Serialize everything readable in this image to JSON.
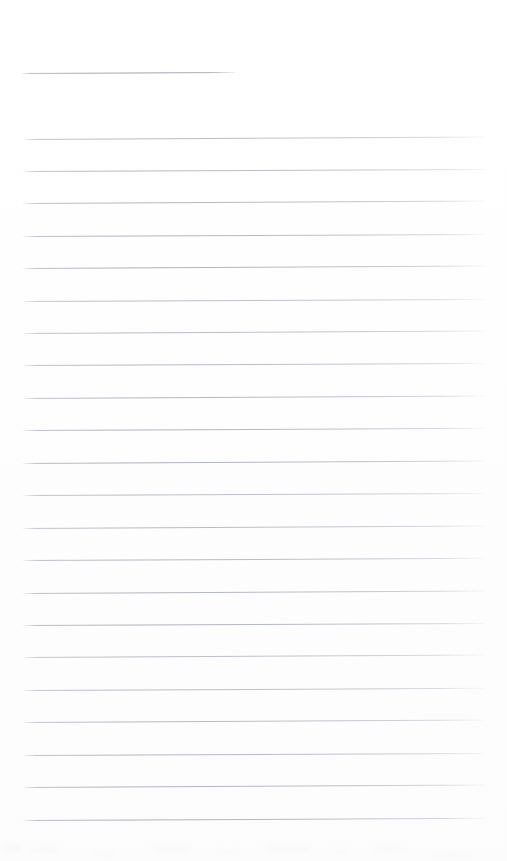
{
  "document": {
    "type": "lined-paper-scan",
    "title": "",
    "text_content": "",
    "is_blank": true,
    "page_width": 507,
    "page_height": 861,
    "background_color": "#fefefe",
    "rule_color": "#b5b9c1",
    "rule_color_light": "#d8dadf",
    "header_rule_color": "#a6aab3"
  },
  "header_rule": {
    "label": "header-rule",
    "x": 22,
    "y": 73,
    "width": 214,
    "tilt_deg": -0.28
  },
  "body_rules": {
    "label": "ruled-lines",
    "left": 23,
    "right": 486,
    "width": 463,
    "first_y": 139,
    "spacing": 32.35,
    "count": 22,
    "lines": [
      {
        "index": 1,
        "y": 139,
        "tilt_deg": -0.3
      },
      {
        "index": 2,
        "y": 171,
        "tilt_deg": -0.26
      },
      {
        "index": 3,
        "y": 203,
        "tilt_deg": -0.3
      },
      {
        "index": 4,
        "y": 236,
        "tilt_deg": -0.24
      },
      {
        "index": 5,
        "y": 268,
        "tilt_deg": -0.3
      },
      {
        "index": 6,
        "y": 301,
        "tilt_deg": -0.26
      },
      {
        "index": 7,
        "y": 333,
        "tilt_deg": -0.3
      },
      {
        "index": 8,
        "y": 365,
        "tilt_deg": -0.25
      },
      {
        "index": 9,
        "y": 398,
        "tilt_deg": -0.3
      },
      {
        "index": 10,
        "y": 430,
        "tilt_deg": -0.27
      },
      {
        "index": 11,
        "y": 463,
        "tilt_deg": -0.3
      },
      {
        "index": 12,
        "y": 495,
        "tilt_deg": -0.25
      },
      {
        "index": 13,
        "y": 528,
        "tilt_deg": -0.3
      },
      {
        "index": 14,
        "y": 560,
        "tilt_deg": -0.27
      },
      {
        "index": 15,
        "y": 593,
        "tilt_deg": -0.3
      },
      {
        "index": 16,
        "y": 625,
        "tilt_deg": -0.25
      },
      {
        "index": 17,
        "y": 657,
        "tilt_deg": -0.3
      },
      {
        "index": 18,
        "y": 690,
        "tilt_deg": -0.27
      },
      {
        "index": 19,
        "y": 722,
        "tilt_deg": -0.3
      },
      {
        "index": 20,
        "y": 755,
        "tilt_deg": -0.25
      },
      {
        "index": 21,
        "y": 787,
        "tilt_deg": -0.3
      },
      {
        "index": 22,
        "y": 820,
        "tilt_deg": -0.27
      }
    ]
  },
  "artifacts": {
    "label": "scan-smudges",
    "band_top": 840,
    "band_height": 20,
    "spots": [
      {
        "x": 28,
        "y": 848,
        "w": 34,
        "h": 6,
        "opacity": 0.3
      },
      {
        "x": 92,
        "y": 851,
        "w": 26,
        "h": 5,
        "opacity": 0.24
      },
      {
        "x": 150,
        "y": 846,
        "w": 40,
        "h": 7,
        "opacity": 0.28
      },
      {
        "x": 214,
        "y": 850,
        "w": 30,
        "h": 5,
        "opacity": 0.22
      },
      {
        "x": 262,
        "y": 845,
        "w": 48,
        "h": 8,
        "opacity": 0.32
      },
      {
        "x": 330,
        "y": 849,
        "w": 22,
        "h": 5,
        "opacity": 0.2
      },
      {
        "x": 372,
        "y": 847,
        "w": 36,
        "h": 6,
        "opacity": 0.26
      },
      {
        "x": 430,
        "y": 851,
        "w": 44,
        "h": 6,
        "opacity": 0.24
      },
      {
        "x": 6,
        "y": 843,
        "w": 14,
        "h": 10,
        "opacity": 0.3
      }
    ]
  }
}
